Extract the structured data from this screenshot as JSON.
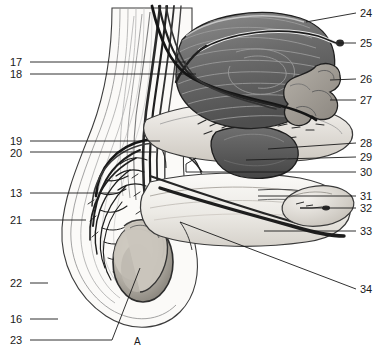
{
  "figure": {
    "panel_label": "A",
    "panel_label_x": 134,
    "panel_label_y": 336,
    "background_color": "#ffffff",
    "ink_color": "#1a1a1a",
    "width": 386,
    "height": 356
  },
  "labels_left": [
    {
      "text": "17",
      "x": 10,
      "y": 57,
      "leader_x1": 30,
      "leader_y1": 62,
      "leader_x2": 186,
      "leader_y2": 62
    },
    {
      "text": "18",
      "x": 10,
      "y": 69,
      "leader_x1": 30,
      "leader_y1": 74,
      "leader_x2": 196,
      "leader_y2": 74
    },
    {
      "text": "19",
      "x": 10,
      "y": 136,
      "leader_x1": 30,
      "leader_y1": 141,
      "leader_x2": 160,
      "leader_y2": 141
    },
    {
      "text": "20",
      "x": 10,
      "y": 148,
      "leader_x1": 30,
      "leader_y1": 152,
      "leader_x2": 156,
      "leader_y2": 152
    },
    {
      "text": "13",
      "x": 10,
      "y": 188,
      "leader_x1": 30,
      "leader_y1": 193,
      "leader_x2": 118,
      "leader_y2": 193
    },
    {
      "text": "21",
      "x": 10,
      "y": 215,
      "leader_x1": 30,
      "leader_y1": 220,
      "leader_x2": 86,
      "leader_y2": 220
    },
    {
      "text": "22",
      "x": 10,
      "y": 278,
      "leader_x1": 30,
      "leader_y1": 283,
      "leader_x2": 48,
      "leader_y2": 283
    },
    {
      "text": "16",
      "x": 10,
      "y": 314,
      "leader_x1": 30,
      "leader_y1": 319,
      "leader_x2": 58,
      "leader_y2": 319
    },
    {
      "text": "23",
      "x": 10,
      "y": 335,
      "leader_x1": 30,
      "leader_y1": 340,
      "leader_x2": 95,
      "leader_y2": 340
    }
  ],
  "labels_right": [
    {
      "text": "24",
      "x": 360,
      "y": 8,
      "leader_x1": 356,
      "leader_y1": 13,
      "leader_x2": 306,
      "leader_y2": 22
    },
    {
      "text": "25",
      "x": 360,
      "y": 38,
      "leader_x1": 356,
      "leader_y1": 43,
      "leader_x2": 338,
      "leader_y2": 43
    },
    {
      "text": "26",
      "x": 360,
      "y": 74,
      "leader_x1": 356,
      "leader_y1": 79,
      "leader_x2": 330,
      "leader_y2": 80
    },
    {
      "text": "27",
      "x": 360,
      "y": 95,
      "leader_x1": 356,
      "leader_y1": 100,
      "leader_x2": 330,
      "leader_y2": 100
    },
    {
      "text": "28",
      "x": 360,
      "y": 138,
      "leader_x1": 356,
      "leader_y1": 143,
      "leader_x2": 268,
      "leader_y2": 149
    },
    {
      "text": "29",
      "x": 360,
      "y": 152,
      "leader_x1": 356,
      "leader_y1": 157,
      "leader_x2": 246,
      "leader_y2": 160
    },
    {
      "text": "30",
      "x": 360,
      "y": 167,
      "leader_x1": 356,
      "leader_y1": 172,
      "leader_x2": 186,
      "leader_y2": 172
    },
    {
      "text": "31",
      "x": 360,
      "y": 191,
      "leader_x1": 356,
      "leader_y1": 196,
      "leader_x2": 258,
      "leader_y2": 196
    },
    {
      "text": "32",
      "x": 360,
      "y": 203,
      "leader_x1": 356,
      "leader_y1": 208,
      "leader_x2": 300,
      "leader_y2": 208
    },
    {
      "text": "33",
      "x": 360,
      "y": 226,
      "leader_x1": 356,
      "leader_y1": 231,
      "leader_x2": 264,
      "leader_y2": 231
    },
    {
      "text": "34",
      "x": 360,
      "y": 284,
      "leader_x1": 356,
      "leader_y1": 289,
      "leader_x2": 180,
      "leader_y2": 222
    }
  ],
  "structures": [
    {
      "name": "urinary-bladder",
      "tone": "#6f6f6f"
    },
    {
      "name": "ureter",
      "tone": "#3a3a3a"
    },
    {
      "name": "seminal-vesicle",
      "tone": "#9a9a9a"
    },
    {
      "name": "prostate-gland",
      "tone": "#5a5a5a"
    },
    {
      "name": "vas-deferens",
      "tone": "#262626"
    },
    {
      "name": "corpus-cavernosum",
      "tone": "#e4e0da"
    },
    {
      "name": "penis-shaft",
      "tone": "#efece7"
    },
    {
      "name": "glans-penis",
      "tone": "#ddd8d1"
    },
    {
      "name": "urethra",
      "tone": "#c9c4bc"
    },
    {
      "name": "testis",
      "tone": "#b9b4ab"
    },
    {
      "name": "epididymis",
      "tone": "#cfcac2"
    },
    {
      "name": "scrotum",
      "tone": "#f3f1ed"
    },
    {
      "name": "spermatic-cord-vessels",
      "tone": "#1f1f1f"
    },
    {
      "name": "pampiniform-plexus",
      "tone": "#2a2a2a"
    }
  ]
}
